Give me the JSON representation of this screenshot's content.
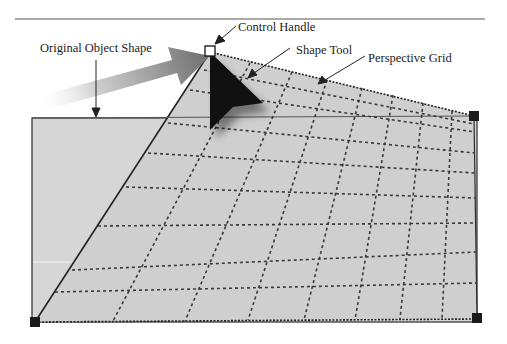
{
  "figure": {
    "labels": {
      "original_object_shape": "Original Object Shape",
      "control_handle": "Control Handle",
      "shape_tool": "Shape Tool",
      "perspective_grid": "Perspective Grid"
    },
    "colors": {
      "background": "#ffffff",
      "rule": "#555555",
      "rect_fill": "#d6d6d6",
      "grid_fill": "#cfcfcf",
      "outline": "#2a2a2a",
      "grid_line": "#3a3a3a",
      "handle": "#1a1a1a",
      "arrow_end": "#6e6e6e",
      "cursor": "#111111"
    },
    "icons": {
      "control_handle": "hollow-square-handle",
      "corner_handles": "filled-square-handle",
      "shape_tool": "arrow-cursor-icon",
      "direction": "gradient-arrow-icon"
    }
  }
}
